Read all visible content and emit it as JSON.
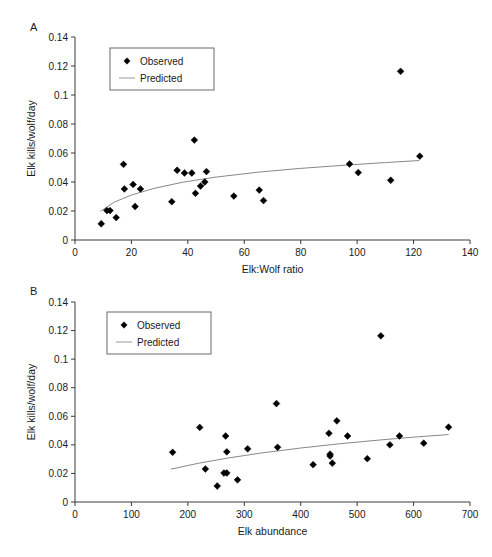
{
  "figure": {
    "background": "#ffffff",
    "marker_color": "#000000",
    "curve_color": "#888888",
    "axis_color": "#3a3a3a"
  },
  "panels": [
    {
      "id": "A",
      "label": "A",
      "legend": {
        "observed_label": "Observed",
        "predicted_label": "Predicted"
      }
    },
    {
      "id": "B",
      "label": "B",
      "legend": {
        "observed_label": "Observed",
        "predicted_label": "Predicted"
      }
    }
  ],
  "chart_data": [
    {
      "type": "scatter",
      "panel": "A",
      "title": "",
      "xlabel": "Elk:Wolf ratio",
      "ylabel": "Elk kills/wolf/day",
      "xlim": [
        0,
        140
      ],
      "ylim": [
        0,
        0.14
      ],
      "xticks": [
        0,
        20,
        40,
        60,
        80,
        100,
        120,
        140
      ],
      "xtick_labels": [
        "0",
        "20",
        "40",
        "60",
        "80",
        "100",
        "120",
        "140"
      ],
      "yticks": [
        0,
        0.02,
        0.04,
        0.06,
        0.08,
        0.1,
        0.12,
        0.14
      ],
      "ytick_labels": [
        "0",
        "0.02",
        "0.04",
        "0.06",
        "0.08",
        "0.1",
        "0.12",
        "0.14"
      ],
      "grid": false,
      "legend_position": "upper-left",
      "series": [
        {
          "name": "Observed",
          "type": "scatter",
          "marker": "diamond",
          "points": [
            {
              "x": 9.3,
              "y": 0.0112
            },
            {
              "x": 11.3,
              "y": 0.0203
            },
            {
              "x": 12.4,
              "y": 0.0203
            },
            {
              "x": 14.6,
              "y": 0.0155
            },
            {
              "x": 17.2,
              "y": 0.0522
            },
            {
              "x": 17.5,
              "y": 0.0352
            },
            {
              "x": 20.6,
              "y": 0.0383
            },
            {
              "x": 21.3,
              "y": 0.0231
            },
            {
              "x": 23.2,
              "y": 0.0352
            },
            {
              "x": 34.3,
              "y": 0.0264
            },
            {
              "x": 36.2,
              "y": 0.0481
            },
            {
              "x": 38.8,
              "y": 0.0462
            },
            {
              "x": 41.4,
              "y": 0.0462
            },
            {
              "x": 42.3,
              "y": 0.0689
            },
            {
              "x": 42.7,
              "y": 0.0322
            },
            {
              "x": 44.5,
              "y": 0.0372
            },
            {
              "x": 46.0,
              "y": 0.04
            },
            {
              "x": 46.6,
              "y": 0.0472
            },
            {
              "x": 56.3,
              "y": 0.0303
            },
            {
              "x": 65.3,
              "y": 0.0344
            },
            {
              "x": 66.8,
              "y": 0.0272
            },
            {
              "x": 97.3,
              "y": 0.0524
            },
            {
              "x": 100.4,
              "y": 0.0465
            },
            {
              "x": 111.9,
              "y": 0.0412
            },
            {
              "x": 115.4,
              "y": 0.1163
            },
            {
              "x": 122.2,
              "y": 0.0578
            }
          ]
        },
        {
          "name": "Predicted",
          "type": "line",
          "points": [
            {
              "x": 9.0,
              "y": 0.0198
            },
            {
              "x": 14.0,
              "y": 0.0262
            },
            {
              "x": 20.0,
              "y": 0.031
            },
            {
              "x": 28.0,
              "y": 0.0356
            },
            {
              "x": 38.0,
              "y": 0.0398
            },
            {
              "x": 50.0,
              "y": 0.0434
            },
            {
              "x": 65.0,
              "y": 0.0468
            },
            {
              "x": 80.0,
              "y": 0.0494
            },
            {
              "x": 95.0,
              "y": 0.0515
            },
            {
              "x": 110.0,
              "y": 0.0534
            },
            {
              "x": 122.0,
              "y": 0.0548
            }
          ]
        }
      ]
    },
    {
      "type": "scatter",
      "panel": "B",
      "title": "",
      "xlabel": "Elk abundance",
      "ylabel": "Elk kills/wolf/day",
      "xlim": [
        0,
        700
      ],
      "ylim": [
        0,
        0.14
      ],
      "xticks": [
        0,
        100,
        200,
        300,
        400,
        500,
        600,
        700
      ],
      "xtick_labels": [
        "0",
        "100",
        "200",
        "300",
        "400",
        "500",
        "600",
        "700"
      ],
      "yticks": [
        0,
        0.02,
        0.04,
        0.06,
        0.08,
        0.1,
        0.12,
        0.14
      ],
      "ytick_labels": [
        "0",
        "0.02",
        "0.04",
        "0.06",
        "0.08",
        "0.1",
        "0.12",
        "0.14"
      ],
      "grid": false,
      "legend_position": "upper-left",
      "series": [
        {
          "name": "Observed",
          "type": "scatter",
          "marker": "diamond",
          "points": [
            {
              "x": 173,
              "y": 0.0348
            },
            {
              "x": 221,
              "y": 0.0522
            },
            {
              "x": 231,
              "y": 0.0231
            },
            {
              "x": 252,
              "y": 0.0112
            },
            {
              "x": 264,
              "y": 0.0203
            },
            {
              "x": 269,
              "y": 0.0203
            },
            {
              "x": 267,
              "y": 0.0462
            },
            {
              "x": 269,
              "y": 0.0351
            },
            {
              "x": 288,
              "y": 0.0155
            },
            {
              "x": 306,
              "y": 0.0372
            },
            {
              "x": 357,
              "y": 0.0689
            },
            {
              "x": 359,
              "y": 0.0383
            },
            {
              "x": 422,
              "y": 0.0261
            },
            {
              "x": 450,
              "y": 0.0481
            },
            {
              "x": 452,
              "y": 0.0335
            },
            {
              "x": 452,
              "y": 0.0322
            },
            {
              "x": 464,
              "y": 0.0568
            },
            {
              "x": 456,
              "y": 0.0272
            },
            {
              "x": 483,
              "y": 0.0462
            },
            {
              "x": 518,
              "y": 0.0303
            },
            {
              "x": 542,
              "y": 0.1163
            },
            {
              "x": 558,
              "y": 0.04
            },
            {
              "x": 575,
              "y": 0.0462
            },
            {
              "x": 618,
              "y": 0.0412
            },
            {
              "x": 662,
              "y": 0.0524
            }
          ]
        },
        {
          "name": "Predicted",
          "type": "line",
          "points": [
            {
              "x": 170,
              "y": 0.023
            },
            {
              "x": 220,
              "y": 0.0272
            },
            {
              "x": 270,
              "y": 0.0307
            },
            {
              "x": 330,
              "y": 0.0343
            },
            {
              "x": 400,
              "y": 0.0378
            },
            {
              "x": 470,
              "y": 0.0408
            },
            {
              "x": 540,
              "y": 0.0434
            },
            {
              "x": 600,
              "y": 0.0454
            },
            {
              "x": 662,
              "y": 0.0472
            }
          ]
        }
      ]
    }
  ]
}
